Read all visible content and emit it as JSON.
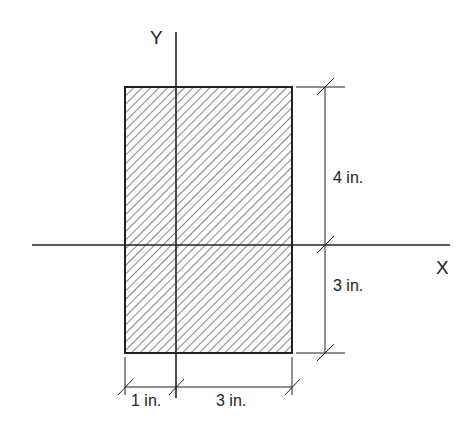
{
  "diagram": {
    "axes": {
      "x_label": "X",
      "y_label": "Y"
    },
    "section": {
      "shape": "rectangle",
      "fill": "hatched",
      "width_in": 4,
      "height_in": 7
    },
    "dimensions": {
      "upper": "4 in.",
      "lower": "3 in.",
      "left": "1 in.",
      "right": "3 in."
    },
    "colors": {
      "line": "#222222",
      "background": "#ffffff"
    }
  }
}
